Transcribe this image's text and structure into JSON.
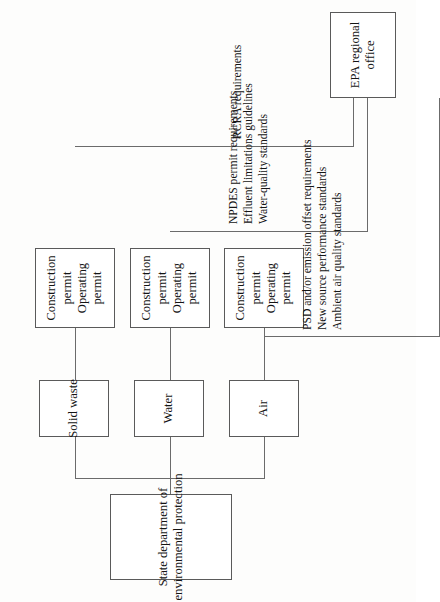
{
  "diagram": {
    "orientation": "rotated-90-counterclockwise",
    "stroke_color": "#6b6b6b",
    "text_color": "#141414",
    "background_color": "#fdfdfc"
  },
  "nodes": {
    "state_dept": {
      "line1": "State department of",
      "line2": "environmental protection"
    },
    "air": {
      "label": "Air"
    },
    "water": {
      "label": "Water"
    },
    "solid_waste": {
      "label": "Solid waste"
    },
    "epa": {
      "line1": "EPA regional",
      "line2": "office"
    },
    "permits_air": {
      "line1": "Construction",
      "line2": "permit",
      "line3": "Operating",
      "line4": "permit"
    },
    "permits_water": {
      "line1": "Construction",
      "line2": "permit",
      "line3": "Operating",
      "line4": "permit"
    },
    "permits_solid_waste": {
      "line1": "Construction",
      "line2": "permit",
      "line3": "Operating",
      "line4": "permit"
    }
  },
  "requirements": {
    "air": [
      "PSD and/or emission offset requirements",
      "New source performance standards",
      "Ambient air quality standards"
    ],
    "water": [
      "NPDES permit requirements",
      "Effluent limitations guidelines",
      "Water-quality standards"
    ],
    "solid_waste": [
      "RCRA requirements"
    ]
  }
}
